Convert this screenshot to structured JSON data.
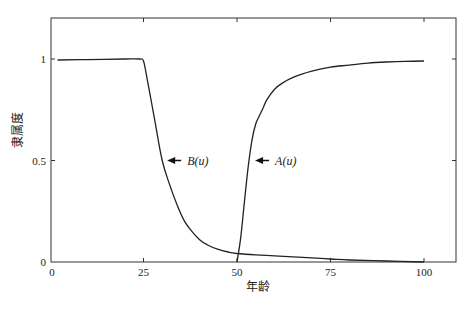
{
  "chart_data": {
    "type": "line",
    "title": "",
    "xlabel": "年龄",
    "ylabel": "隶属度",
    "xlim": [
      0,
      108.6
    ],
    "ylim": [
      0,
      1.2
    ],
    "xticks": [
      0,
      25,
      50,
      75,
      100
    ],
    "xtick_labels": [
      "0",
      "25",
      "50",
      "75",
      "100"
    ],
    "yticks": [
      0,
      0.5,
      1
    ],
    "ytick_labels": [
      "0",
      "0.5",
      "1"
    ],
    "grid": false,
    "legend": null,
    "series": [
      {
        "name": "B(u)",
        "x": [
          2,
          10,
          20,
          24,
          25,
          26,
          27,
          28,
          30,
          32,
          34,
          36,
          38,
          40,
          42,
          45,
          48,
          50,
          55,
          60,
          70,
          75,
          80,
          90,
          100
        ],
        "values": [
          0.995,
          0.997,
          1.0,
          1.0,
          0.99,
          0.9,
          0.8,
          0.7,
          0.5,
          0.38,
          0.28,
          0.2,
          0.15,
          0.11,
          0.085,
          0.062,
          0.048,
          0.042,
          0.035,
          0.03,
          0.02,
          0.015,
          0.01,
          0.005,
          0.0
        ]
      },
      {
        "name": "A(u)",
        "x": [
          50,
          51,
          52,
          53,
          54,
          55,
          56,
          57,
          58,
          60,
          62,
          65,
          70,
          75,
          80,
          85,
          90,
          95,
          100
        ],
        "values": [
          0.0,
          0.12,
          0.3,
          0.47,
          0.6,
          0.68,
          0.72,
          0.76,
          0.8,
          0.85,
          0.88,
          0.91,
          0.94,
          0.96,
          0.97,
          0.98,
          0.985,
          0.988,
          0.99
        ]
      }
    ],
    "annotations": [
      {
        "text": "B(u)",
        "arrow_to": [
          30,
          0.5
        ],
        "text_pos": [
          34.5,
          0.5
        ]
      },
      {
        "text": "A(u)",
        "arrow_to": [
          53.5,
          0.5
        ],
        "text_pos": [
          58,
          0.5
        ]
      }
    ]
  },
  "labels": {
    "xlabel": "年龄",
    "ylabel": "隶属度"
  }
}
